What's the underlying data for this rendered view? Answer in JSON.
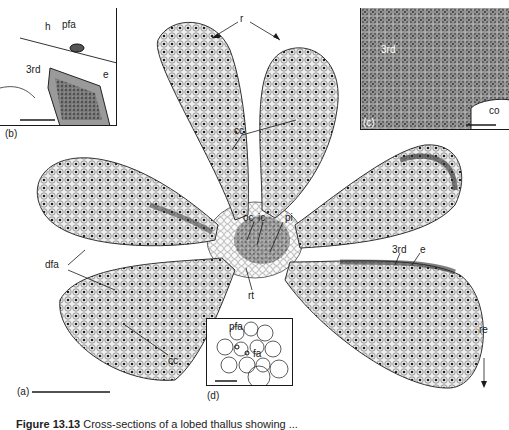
{
  "figure": {
    "panels": [
      "(a)",
      "(b)",
      "(c)",
      "(d)"
    ],
    "main_labels": {
      "r": "r",
      "cc_upper": "cc",
      "oc": "oc",
      "ic": "ic",
      "pi": "pi",
      "dfa": "dfa",
      "cc_lower": "cc",
      "rt": "rt",
      "third": "3rd",
      "e": "e",
      "re": "re"
    },
    "inset_b": {
      "label": "(b)",
      "h": "h",
      "pfa": "pfa",
      "third": "3rd",
      "e": "e"
    },
    "inset_c": {
      "label": "(c)",
      "third": "3rd",
      "co": "co"
    },
    "inset_d": {
      "label": "(d)",
      "pfa": "pfa",
      "fa": "fa"
    },
    "colors": {
      "ink": "#1a1a1a",
      "tissue_dark": "#3a3a3a",
      "tissue_mid": "#8a8a8a",
      "tissue_light": "#d8d8d8",
      "background": "#ffffff"
    }
  },
  "caption": {
    "label": "Figure 13.13",
    "text": "Cross-sections of a lobed thallus showing ..."
  }
}
